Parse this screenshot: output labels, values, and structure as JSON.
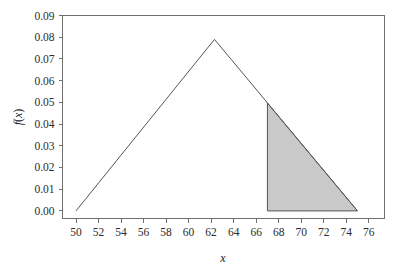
{
  "chart_data": {
    "type": "line",
    "title": "",
    "xlabel": "x",
    "ylabel": "f(x)",
    "xlim": [
      48.8,
      77.4
    ],
    "ylim": [
      -0.0035,
      0.09
    ],
    "grid": false,
    "legend": null,
    "x_ticks": [
      50,
      52,
      54,
      56,
      58,
      60,
      62,
      64,
      66,
      68,
      70,
      72,
      74,
      76
    ],
    "x_tick_labels": [
      "50",
      "52",
      "54",
      "56",
      "58",
      "60",
      "62",
      "64",
      "66",
      "68",
      "70",
      "72",
      "74",
      "76"
    ],
    "y_ticks": [
      0.0,
      0.01,
      0.02,
      0.03,
      0.04,
      0.05,
      0.06,
      0.07,
      0.08,
      0.09
    ],
    "y_tick_labels": [
      "0.00",
      "0.01",
      "0.02",
      "0.03",
      "0.04",
      "0.05",
      "0.06",
      "0.07",
      "0.08",
      "0.09"
    ],
    "series": [
      {
        "name": "triangular-density",
        "type": "line",
        "x": [
          50,
          62.3,
          75
        ],
        "y": [
          0.0,
          0.079,
          0.0
        ]
      }
    ],
    "annotations": [
      {
        "name": "shaded-area",
        "kind": "filled-region",
        "x_from": 67,
        "x_to": 75,
        "y_at_x_from": 0.0497,
        "y_at_x_to": 0.0,
        "fill_color": "#c9c9c9",
        "edge_color": "#555555"
      }
    ],
    "colors": {
      "curve": "#555555",
      "axis": "#6f6f6f",
      "shade_fill": "#c9c9c9",
      "background": "#ffffff",
      "text": "#1a1a1a"
    }
  }
}
